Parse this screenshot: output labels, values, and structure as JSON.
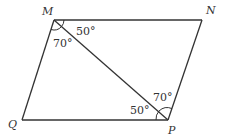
{
  "diagram": {
    "type": "parallelogram",
    "vertices": {
      "M": {
        "label": "M",
        "x": 54,
        "y": 20
      },
      "N": {
        "label": "N",
        "x": 202,
        "y": 20
      },
      "P": {
        "label": "P",
        "x": 168,
        "y": 120
      },
      "Q": {
        "label": "Q",
        "x": 22,
        "y": 120
      }
    },
    "diagonal": [
      "M",
      "P"
    ],
    "angles": {
      "NMP": "50°",
      "QMP": "70°",
      "MPN": "70°",
      "MPQ": "50°"
    },
    "colors": {
      "stroke": "#333333",
      "background": "#ffffff"
    }
  }
}
